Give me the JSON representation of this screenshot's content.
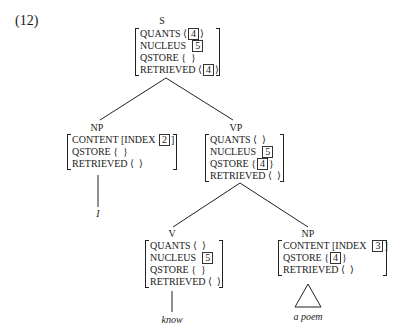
{
  "example_number": "(12)",
  "nodes": {
    "s": {
      "label": "S",
      "features": [
        {
          "attr": "QUANTS",
          "open": "⟨",
          "tag": "4",
          "close": "⟩"
        },
        {
          "attr": "NUCLEUS",
          "open": "",
          "tag": "5",
          "close": ""
        },
        {
          "attr": "QSTORE",
          "open": "{",
          "tag": "",
          "close": "}"
        },
        {
          "attr": "RETRIEVED",
          "open": "⟨",
          "tag": "4",
          "close": "⟩"
        }
      ]
    },
    "np_subject": {
      "label": "NP",
      "features": [
        {
          "attr": "CONTENT",
          "open": "[INDEX",
          "tag": "2",
          "close": "]"
        },
        {
          "attr": "QSTORE",
          "open": "{",
          "tag": "",
          "close": "}"
        },
        {
          "attr": "RETRIEVED",
          "open": "⟨",
          "tag": "",
          "close": "⟩"
        }
      ],
      "word": "I"
    },
    "vp": {
      "label": "VP",
      "features": [
        {
          "attr": "QUANTS",
          "open": "⟨",
          "tag": "",
          "close": "⟩"
        },
        {
          "attr": "NUCLEUS",
          "open": "",
          "tag": "5",
          "close": ""
        },
        {
          "attr": "QSTORE",
          "open": "{",
          "tag": "4",
          "close": "}"
        },
        {
          "attr": "RETRIEVED",
          "open": "⟨",
          "tag": "",
          "close": "⟩"
        }
      ]
    },
    "v": {
      "label": "V",
      "features": [
        {
          "attr": "QUANTS",
          "open": "⟨",
          "tag": "",
          "close": "⟩"
        },
        {
          "attr": "NUCLEUS",
          "open": "",
          "tag": "5",
          "close": ""
        },
        {
          "attr": "QSTORE",
          "open": "{",
          "tag": "",
          "close": "}"
        },
        {
          "attr": "RETRIEVED",
          "open": "⟨",
          "tag": "",
          "close": "⟩"
        }
      ],
      "word": "know"
    },
    "np_object": {
      "label": "NP",
      "features": [
        {
          "attr": "CONTENT",
          "open": "[INDEX",
          "tag": "3",
          "close": "]"
        },
        {
          "attr": "QSTORE",
          "open": "{",
          "tag": "4",
          "close": "}"
        },
        {
          "attr": "RETRIEVED",
          "open": "⟨",
          "tag": "",
          "close": "⟩"
        }
      ],
      "word": "a poem"
    }
  }
}
